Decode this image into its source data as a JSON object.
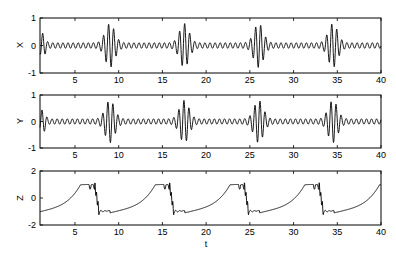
{
  "chart_data": [
    {
      "type": "line",
      "title": "",
      "xlabel": "",
      "ylabel": "X",
      "xlim": [
        1,
        40
      ],
      "ylim": [
        -1,
        1
      ],
      "xticks": [
        5,
        10,
        15,
        20,
        25,
        30,
        35,
        40
      ],
      "yticks": [
        -1,
        0,
        1
      ],
      "grid": false,
      "description": "Oscillatory signal with small-amplitude ripple (~0.1) and bursts of large amplitude (~0.8) centered near t=9, 17.5, 26, 34.5",
      "burst_centers": [
        9,
        17.5,
        26,
        34.5
      ],
      "burst_amplitude": 0.8,
      "baseline_amplitude": 0.1
    },
    {
      "type": "line",
      "title": "",
      "xlabel": "",
      "ylabel": "Y",
      "xlim": [
        1,
        40
      ],
      "ylim": [
        -1,
        1
      ],
      "xticks": [
        5,
        10,
        15,
        20,
        25,
        30,
        35,
        40
      ],
      "yticks": [
        -1,
        0,
        1
      ],
      "grid": false,
      "description": "Oscillatory signal similar to X with bursts near t=9, 17.5, 26, 34.5",
      "burst_centers": [
        9,
        17.5,
        26,
        34.5
      ],
      "burst_amplitude": 0.8,
      "baseline_amplitude": 0.1
    },
    {
      "type": "line",
      "title": "",
      "xlabel": "t",
      "ylabel": "Z",
      "xlim": [
        1,
        40
      ],
      "ylim": [
        -2,
        2
      ],
      "xticks": [
        5,
        10,
        15,
        20,
        25,
        30,
        35,
        40
      ],
      "yticks": [
        -2,
        0,
        2
      ],
      "grid": false,
      "description": "Relaxation oscillation: slow rise from about -1 to 1, plateau, then sharp drop with ringing; period ~8.6",
      "x": [
        1,
        1.5,
        3,
        5,
        6,
        7,
        8,
        8.5,
        9,
        9.5,
        10,
        12,
        14,
        15,
        16,
        17,
        17.5,
        18,
        18.5,
        19,
        21,
        23,
        24,
        25,
        26,
        26.5,
        27,
        27.5,
        30,
        32,
        33,
        34,
        34.5,
        35,
        35.5,
        36,
        38,
        40
      ],
      "values": [
        -1.0,
        -1.2,
        -0.8,
        -0.4,
        0.2,
        0.95,
        1.0,
        0.9,
        -0.6,
        -1.1,
        -0.9,
        -0.6,
        -0.3,
        0.2,
        0.95,
        1.0,
        0.9,
        -0.6,
        -1.1,
        -0.9,
        -0.6,
        -0.3,
        0.2,
        0.95,
        1.0,
        -0.6,
        -1.1,
        -0.9,
        -0.6,
        -0.3,
        0.2,
        0.95,
        1.0,
        -0.6,
        -1.1,
        -0.9,
        -0.6,
        0.2
      ]
    }
  ],
  "axes": {
    "top": {
      "ylabel": "X",
      "yticks": [
        "1",
        "0",
        "-1"
      ],
      "xticks": [
        "5",
        "10",
        "15",
        "20",
        "25",
        "30",
        "35",
        "40"
      ]
    },
    "middle": {
      "ylabel": "Y",
      "yticks": [
        "1",
        "0",
        "-1"
      ],
      "xticks": [
        "5",
        "10",
        "15",
        "20",
        "25",
        "30",
        "35",
        "40"
      ]
    },
    "bottom": {
      "ylabel": "Z",
      "yticks": [
        "2",
        "0",
        "-2"
      ],
      "xticks": [
        "5",
        "10",
        "15",
        "20",
        "25",
        "30",
        "35",
        "40"
      ],
      "xlabel": "t"
    }
  },
  "colors": {
    "line": "#000000",
    "axes": "#000000",
    "background": "#ffffff"
  }
}
